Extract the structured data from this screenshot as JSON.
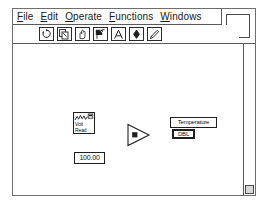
{
  "app": {
    "name": "LabVIEW Block Diagram"
  },
  "menubar": {
    "items": [
      {
        "name": "file",
        "hotkey": "F",
        "rest": "ile"
      },
      {
        "name": "edit",
        "hotkey": "E",
        "rest": "dit"
      },
      {
        "name": "operate",
        "hotkey": "O",
        "rest": "perate"
      },
      {
        "name": "functions",
        "hotkey": "F",
        "rest": "unctions"
      },
      {
        "name": "windows",
        "hotkey": "W",
        "rest": "indows"
      }
    ]
  },
  "toolbar": {
    "buttons": [
      {
        "name": "operate-tool",
        "icon": "pointing-hand-rotate-icon",
        "selected": false
      },
      {
        "name": "position-tool",
        "icon": "arrow-pages-icon",
        "selected": false
      },
      {
        "name": "scroll-tool",
        "icon": "open-hand-icon",
        "selected": false
      },
      {
        "name": "wiring-tool",
        "icon": "spool-wire-icon",
        "selected": true
      },
      {
        "name": "text-tool",
        "icon": "letter-a-icon",
        "selected": false
      },
      {
        "name": "color-tool",
        "icon": "diamond-brush-icon",
        "selected": false
      },
      {
        "name": "edit-tool",
        "icon": "pencil-icon",
        "selected": false
      }
    ]
  },
  "window_controls": {
    "zoom_box": "zoom-box"
  },
  "diagram": {
    "subvi": {
      "name": "volt-read-subvi",
      "line1": "Volt",
      "line2": "Read"
    },
    "numeric_constant": {
      "name": "numeric-constant",
      "value": "100.00"
    },
    "multiply_node": {
      "name": "multiply-node",
      "operator": "x"
    },
    "indicator": {
      "name": "temperature-indicator",
      "label": "Temperature",
      "datatype": "DBL"
    }
  },
  "scrollbar": {
    "name": "vertical-scrollbar",
    "grow_box": "resize-grow-box"
  },
  "colors": {
    "frame": "#6e6e6e",
    "ink": "#1f1f1f",
    "canvas": "#ffffff",
    "grow_box_fill": "#d9d9d9"
  }
}
